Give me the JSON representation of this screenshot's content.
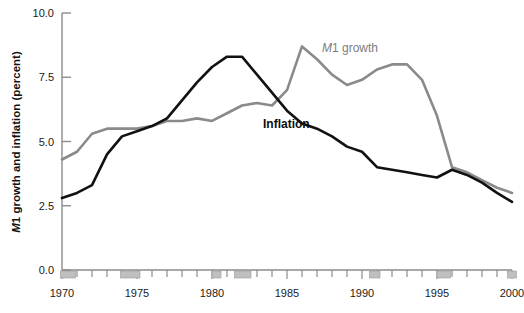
{
  "chart_data": {
    "type": "line",
    "title": "",
    "xlabel": "",
    "ylabel": "M1 growth and inflation (percent)",
    "ylabel_italic_prefix": "M",
    "ylabel_rest": "1 growth and inflation (percent)",
    "xlim": [
      1970,
      2000
    ],
    "ylim": [
      0.0,
      10.0
    ],
    "ytick_labels": [
      "0.0",
      "2.5",
      "5.0",
      "7.5",
      "10.0"
    ],
    "ytick_values": [
      0.0,
      2.5,
      5.0,
      7.5,
      10.0
    ],
    "xtick_labels": [
      "1970",
      "1975",
      "1980",
      "1985",
      "1990",
      "1995",
      "2000"
    ],
    "xtick_values": [
      1970,
      1975,
      1980,
      1985,
      1990,
      1995,
      2000
    ],
    "xminor_step": 1,
    "grid": false,
    "legend_position": "inline-annotations",
    "colors": {
      "m1_growth": "#8a8a8a",
      "inflation": "#111111",
      "axis": "#808080",
      "recession_band": "#bfbfbf",
      "background": "#ffffff"
    },
    "annotations": [
      {
        "name": "m1-growth-label",
        "text_italic": "M",
        "text": "1 growth",
        "x": 1987.8,
        "y": 8.45,
        "color": "#7d7d7d"
      },
      {
        "name": "inflation-label",
        "text": "Inflation",
        "x": 1983.6,
        "y": 5.55,
        "color": "#0d0d0d"
      }
    ],
    "recession_bands": [
      {
        "start": 1969.9,
        "end": 1970.9
      },
      {
        "start": 1973.9,
        "end": 1975.2
      },
      {
        "start": 1980.0,
        "end": 1980.6
      },
      {
        "start": 1981.5,
        "end": 1982.6
      },
      {
        "start": 1990.5,
        "end": 1991.2
      },
      {
        "start": 1995.0,
        "end": 1995.9
      },
      {
        "start": 1999.7,
        "end": 2000.3
      }
    ],
    "x": [
      1970,
      1971,
      1972,
      1973,
      1974,
      1975,
      1976,
      1977,
      1978,
      1979,
      1980,
      1981,
      1982,
      1983,
      1984,
      1985,
      1986,
      1987,
      1988,
      1989,
      1990,
      1991,
      1992,
      1993,
      1994,
      1995,
      1996,
      1997,
      1998,
      1999,
      2000
    ],
    "series": [
      {
        "name": "M1 growth",
        "color": "#8a8a8a",
        "values": [
          4.3,
          4.6,
          5.3,
          5.5,
          5.5,
          5.5,
          5.6,
          5.8,
          5.8,
          5.9,
          5.8,
          6.1,
          6.4,
          6.5,
          6.4,
          7.0,
          8.7,
          8.2,
          7.6,
          7.2,
          7.4,
          7.8,
          8.0,
          8.0,
          7.4,
          6.0,
          4.0,
          3.8,
          3.5,
          3.2,
          3.0
        ]
      },
      {
        "name": "Inflation",
        "color": "#111111",
        "values": [
          2.8,
          3.0,
          3.3,
          4.5,
          5.2,
          5.4,
          5.6,
          5.9,
          6.6,
          7.3,
          7.9,
          8.3,
          8.3,
          7.6,
          6.9,
          6.2,
          5.7,
          5.5,
          5.2,
          4.8,
          4.6,
          4.0,
          3.9,
          3.8,
          3.7,
          3.6,
          3.9,
          3.7,
          3.4,
          3.0,
          2.65
        ]
      }
    ]
  }
}
